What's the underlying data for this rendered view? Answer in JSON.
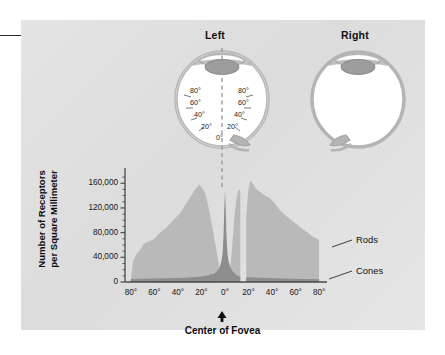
{
  "figure": {
    "eye_titles": {
      "left": "Left",
      "right": "Right"
    },
    "eye_degree_labels_left": [
      "80°",
      "60°",
      "40°",
      "20°"
    ],
    "eye_degree_labels_right": [
      "80°",
      "60°",
      "40°",
      "20°"
    ],
    "eye_center_label": "0°",
    "callout": {
      "name": "leader-line-dot"
    }
  },
  "chart_data": {
    "type": "area",
    "title": "",
    "xlabel": "Center of Fovea",
    "ylabel": "Number of Receptors\nper Square Millimeter",
    "ylabel_line1": "Number of Receptors",
    "ylabel_line2": "per Square Millimeter",
    "xtick_labels": [
      "80°",
      "60°",
      "40°",
      "20°",
      "0°",
      "20°",
      "40°",
      "60°",
      "80°"
    ],
    "xtick_values": [
      -80,
      -60,
      -40,
      -20,
      0,
      20,
      40,
      60,
      80
    ],
    "ytick_labels": [
      "0",
      "40,000",
      "80,000",
      "120,000",
      "160,000"
    ],
    "ytick_values": [
      0,
      40000,
      80000,
      120000,
      160000
    ],
    "ylim": [
      0,
      175000
    ],
    "xlim": [
      -85,
      85
    ],
    "grid": false,
    "legend_position": "right-outside",
    "annotations": [
      "Rods",
      "Cones"
    ],
    "blind_spot": {
      "from_deg": 13,
      "to_deg": 18,
      "label": "blind spot gap"
    },
    "series": [
      {
        "name": "Rods",
        "color": "#b9b9b9",
        "x": [
          -80,
          -78,
          -75,
          -72,
          -70,
          -67,
          -64,
          -60,
          -57,
          -54,
          -50,
          -46,
          -42,
          -38,
          -34,
          -30,
          -26,
          -22,
          -19,
          -17,
          -15,
          -13,
          -11,
          -9,
          -7,
          -5,
          -4,
          -3,
          -2,
          -1,
          0,
          1,
          2,
          3,
          4,
          5,
          6,
          7,
          8,
          9,
          10,
          11,
          12,
          13,
          13,
          18,
          18,
          19,
          20,
          21,
          22,
          24,
          27,
          30,
          34,
          38,
          42,
          46,
          50,
          54,
          58,
          62,
          66,
          70,
          74,
          78,
          80,
          80
        ],
        "y": [
          6000,
          34000,
          46000,
          52000,
          60000,
          64000,
          66000,
          70000,
          76000,
          82000,
          88000,
          96000,
          104000,
          112000,
          124000,
          136000,
          148000,
          158000,
          152000,
          144000,
          130000,
          112000,
          92000,
          70000,
          48000,
          26000,
          16000,
          9000,
          4000,
          1500,
          0,
          1500,
          4000,
          9000,
          18000,
          34000,
          56000,
          80000,
          104000,
          124000,
          138000,
          146000,
          150000,
          148000,
          0,
          0,
          104000,
          132000,
          150000,
          160000,
          164000,
          158000,
          150000,
          146000,
          140000,
          136000,
          128000,
          118000,
          110000,
          104000,
          98000,
          92000,
          86000,
          80000,
          74000,
          70000,
          68000,
          0
        ]
      },
      {
        "name": "Cones",
        "color": "#8d8d8d",
        "x": [
          -80,
          -70,
          -60,
          -50,
          -40,
          -34,
          -30,
          -24,
          -20,
          -16,
          -12,
          -9,
          -7,
          -5,
          -4,
          -3,
          -2,
          -1.2,
          -0.6,
          0,
          0.6,
          1.2,
          2,
          3,
          4,
          5,
          7,
          9,
          12,
          13,
          13,
          18,
          18,
          20,
          24,
          30,
          36,
          42,
          50,
          58,
          66,
          74,
          80,
          80
        ],
        "y": [
          5000,
          5200,
          5600,
          6000,
          6400,
          7000,
          7400,
          8200,
          9000,
          10000,
          12000,
          14000,
          17000,
          22000,
          27000,
          34000,
          46000,
          78000,
          120000,
          148000,
          120000,
          78000,
          46000,
          34000,
          27000,
          22000,
          16000,
          12000,
          9000,
          8400,
          0,
          0,
          7800,
          7600,
          7200,
          6800,
          6400,
          6000,
          5600,
          5200,
          5000,
          4800,
          4600,
          0
        ]
      }
    ]
  },
  "colors": {
    "panel_bg": "#e0e0e0",
    "rods": "#b9b9b9",
    "cones": "#8d8d8d",
    "axis": "#4a4a4a",
    "text": "#111111",
    "eye_sclera": "#ffffff",
    "eye_outline": "#b0b0b0",
    "eye_lens": "#9d9d9d"
  }
}
